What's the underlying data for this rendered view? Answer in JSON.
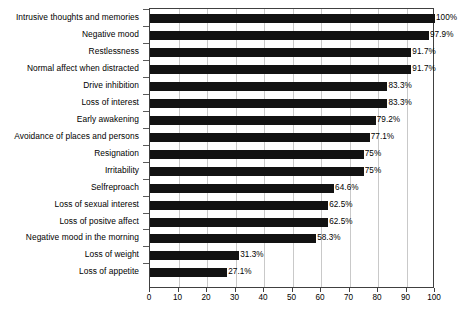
{
  "chart_data": {
    "type": "bar",
    "orientation": "horizontal",
    "title": "",
    "xlabel": "",
    "ylabel": "",
    "xlim": [
      0,
      100
    ],
    "xticks": [
      0,
      10,
      20,
      30,
      40,
      50,
      60,
      70,
      80,
      90,
      100
    ],
    "grid": true,
    "legend": false,
    "bar_color": "#121212",
    "frame_color": "#404040",
    "gridline_color": "#c9c9c9",
    "categories": [
      "Intrusive thoughts and memories",
      "Negative mood",
      "Restlessness",
      "Normal affect when distracted",
      "Drive inhibition",
      "Loss of interest",
      "Early awakening",
      "Avoidance of places and persons",
      "Resignation",
      "Irritability",
      "Selfreproach",
      "Loss of sexual interest",
      "Loss of positve affect",
      "Negative mood in the morning",
      "Loss of weight",
      "Loss of appetite"
    ],
    "values": [
      100,
      97.9,
      91.7,
      91.7,
      83.3,
      83.3,
      79.2,
      77.1,
      75,
      75,
      64.6,
      62.5,
      62.5,
      58.3,
      31.3,
      27.1
    ],
    "data_labels": [
      "100%",
      "97.9%",
      "91.7%",
      "91.7%",
      "83.3%",
      "83.3%",
      "79.2%",
      "77.1%",
      "75%",
      "75%",
      "64.6%",
      "62.5%",
      "62.5%",
      "58.3%",
      "31.3%",
      "27.1%"
    ]
  }
}
